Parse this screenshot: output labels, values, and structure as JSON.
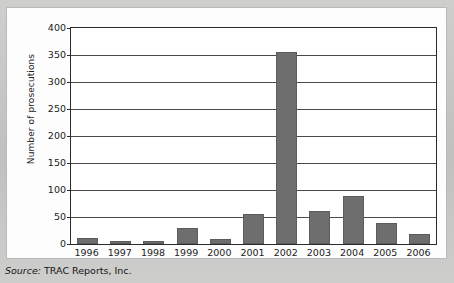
{
  "figure": {
    "background_color": "#c8c8c6",
    "panel_color": "#fdfdfd",
    "bar_color": "#6e6e6e",
    "axis_color": "#2b2b2b"
  },
  "source": {
    "key": "Source:",
    "value": " TRAC Reports, Inc."
  },
  "chart_data": {
    "type": "bar",
    "title": "",
    "xlabel": "",
    "ylabel": "Number of prosecutions",
    "categories": [
      "1996",
      "1997",
      "1998",
      "1999",
      "2000",
      "2001",
      "2002",
      "2003",
      "2004",
      "2005",
      "2006"
    ],
    "values": [
      11,
      5,
      5,
      30,
      9,
      56,
      355,
      62,
      89,
      38,
      18
    ],
    "ylim": [
      0,
      400
    ],
    "yticks": [
      0,
      50,
      100,
      150,
      200,
      250,
      300,
      350,
      400
    ],
    "ytick_labels": [
      "0",
      "50",
      "100",
      "150",
      "200",
      "250",
      "300",
      "350",
      "400"
    ],
    "grid": true,
    "grid_axis": "y",
    "legend": false,
    "legend_position": "none",
    "series": [
      {
        "name": "Number of prosecutions",
        "values": [
          11,
          5,
          5,
          30,
          9,
          56,
          355,
          62,
          89,
          38,
          18
        ]
      }
    ]
  }
}
